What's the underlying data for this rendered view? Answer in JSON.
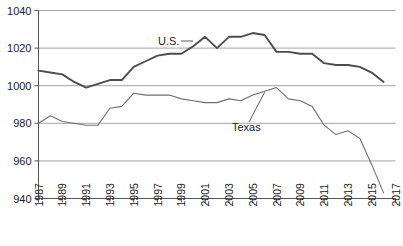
{
  "chart_data": {
    "type": "line",
    "title": "",
    "subtitle": "",
    "xlabel": "",
    "ylabel": "",
    "xlim": [
      1987,
      2017
    ],
    "ylim": [
      940,
      1040
    ],
    "grid": true,
    "legend_position": "inline-annotations",
    "x": [
      1987,
      1988,
      1989,
      1990,
      1991,
      1992,
      1993,
      1994,
      1995,
      1996,
      1997,
      1998,
      1999,
      2000,
      2001,
      2002,
      2003,
      2004,
      2005,
      2006,
      2007,
      2008,
      2009,
      2010,
      2011,
      2012,
      2013,
      2014,
      2015,
      2016
    ],
    "series": [
      {
        "name": "U.S.",
        "values": [
          1008,
          1007,
          1006,
          1002,
          999,
          1001,
          1003,
          1003,
          1010,
          1013,
          1016,
          1017,
          1017,
          1021,
          1026,
          1020,
          1026,
          1026,
          1028,
          1027,
          1018,
          1018,
          1017,
          1017,
          1012,
          1011,
          1011,
          1010,
          1007,
          1002
        ]
      },
      {
        "name": "Texas",
        "values": [
          980,
          984,
          981,
          980,
          979,
          979,
          988,
          989,
          996,
          995,
          995,
          995,
          993,
          992,
          991,
          991,
          993,
          992,
          995,
          997,
          999,
          993,
          992,
          989,
          979,
          974,
          976,
          972,
          958,
          943
        ]
      }
    ],
    "xticks": [
      1987,
      1989,
      1991,
      1993,
      1995,
      1997,
      1999,
      2001,
      2003,
      2005,
      2007,
      2009,
      2011,
      2013,
      2015,
      2017
    ],
    "xtick_labels": [
      "1987",
      "1989",
      "1991",
      "1993",
      "1995",
      "1997",
      "1999",
      "2001",
      "2003",
      "2005",
      "2007",
      "2009",
      "2011",
      "2013",
      "2015",
      "2017"
    ],
    "yticks": [
      940,
      960,
      980,
      1000,
      1020,
      1040
    ],
    "ytick_labels": [
      "940",
      "960",
      "980",
      "1000",
      "1020",
      "1040"
    ],
    "annotations": [
      {
        "text": "U.S.",
        "series": "U.S."
      },
      {
        "text": "Texas",
        "series": "Texas"
      }
    ],
    "colors": {
      "series_us": "#4c4c4c",
      "series_texas": "#6e6e6e",
      "gridline": "#9a9a9a",
      "axis": "#555555",
      "background": "#ffffff",
      "text": "#222222"
    }
  }
}
